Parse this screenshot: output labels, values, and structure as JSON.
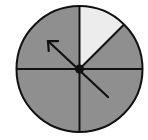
{
  "spinner": {
    "title": "Spinner",
    "center": [
      79.5,
      69
    ],
    "radius": 63,
    "colors": {
      "shaded": "#8f8f8f",
      "unshaded": "#ececec",
      "outline": "#111111",
      "background": "#ffffff"
    },
    "sections": [
      {
        "name": "upper-right-top",
        "start_deg": 0,
        "end_deg": 45,
        "shade": "unshaded"
      },
      {
        "name": "upper-right-bottom",
        "start_deg": 45,
        "end_deg": 90,
        "shade": "shaded"
      },
      {
        "name": "lower-right",
        "start_deg": 90,
        "end_deg": 180,
        "shade": "shaded"
      },
      {
        "name": "lower-left",
        "start_deg": 180,
        "end_deg": 270,
        "shade": "shaded"
      },
      {
        "name": "upper-left",
        "start_deg": 270,
        "end_deg": 360,
        "shade": "shaded"
      }
    ],
    "arrow": {
      "tail": [
        108,
        97
      ],
      "tip": [
        48,
        41
      ],
      "pivot_radius": 4.5
    }
  }
}
